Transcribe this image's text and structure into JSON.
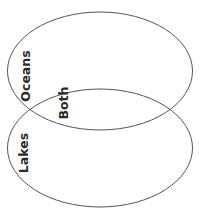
{
  "diagram": {
    "type": "venn",
    "sets": [
      {
        "label": "Oceans",
        "region": "top"
      },
      {
        "label": "Lakes",
        "region": "bottom"
      }
    ],
    "intersection_label": "Both",
    "colors": {
      "stroke": "#555555",
      "text": "#2b2b2b",
      "background": "#ffffff"
    }
  }
}
